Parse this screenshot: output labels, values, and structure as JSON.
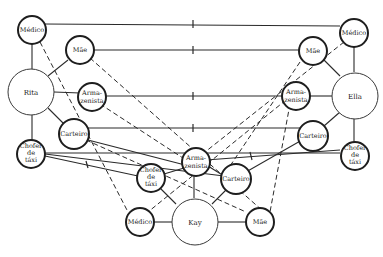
{
  "diagram": {
    "nodes": {
      "l_medico": {
        "label": "Médico"
      },
      "l_mae": {
        "label": "Mãe"
      },
      "l_rita": {
        "label": "Rita"
      },
      "l_arma_1": {
        "label": "Arma-"
      },
      "l_arma_2": {
        "label": "zenista"
      },
      "l_carteiro": {
        "label": "Carteiro"
      },
      "l_chofer_1": {
        "label": "Chofer"
      },
      "l_chofer_2": {
        "label": "de"
      },
      "l_chofer_3": {
        "label": "táxi"
      },
      "r_medico": {
        "label": "Médico"
      },
      "r_mae": {
        "label": "Mãe"
      },
      "r_ella": {
        "label": "Ella"
      },
      "r_arma_1": {
        "label": "Arma-"
      },
      "r_arma_2": {
        "label": "zenista"
      },
      "r_carteiro": {
        "label": "Carteiro"
      },
      "r_chofer_1": {
        "label": "Chofer"
      },
      "r_chofer_2": {
        "label": "de"
      },
      "r_chofer_3": {
        "label": "táxi"
      },
      "c_arma_1": {
        "label": "Arma-"
      },
      "c_arma_2": {
        "label": "zenista"
      },
      "c_chofer_1": {
        "label": "Chofer"
      },
      "c_chofer_2": {
        "label": "de"
      },
      "c_chofer_3": {
        "label": "táxi"
      },
      "c_carteiro": {
        "label": "Carteiro"
      },
      "c_kay": {
        "label": "Kay"
      },
      "c_medico": {
        "label": "Médico"
      },
      "c_mae": {
        "label": "Mãe"
      }
    },
    "groups": [
      "Rita",
      "Ella",
      "Kay"
    ],
    "roles": [
      "Médico",
      "Mãe",
      "Armazenista",
      "Carteiro",
      "Chofer de táxi"
    ]
  }
}
